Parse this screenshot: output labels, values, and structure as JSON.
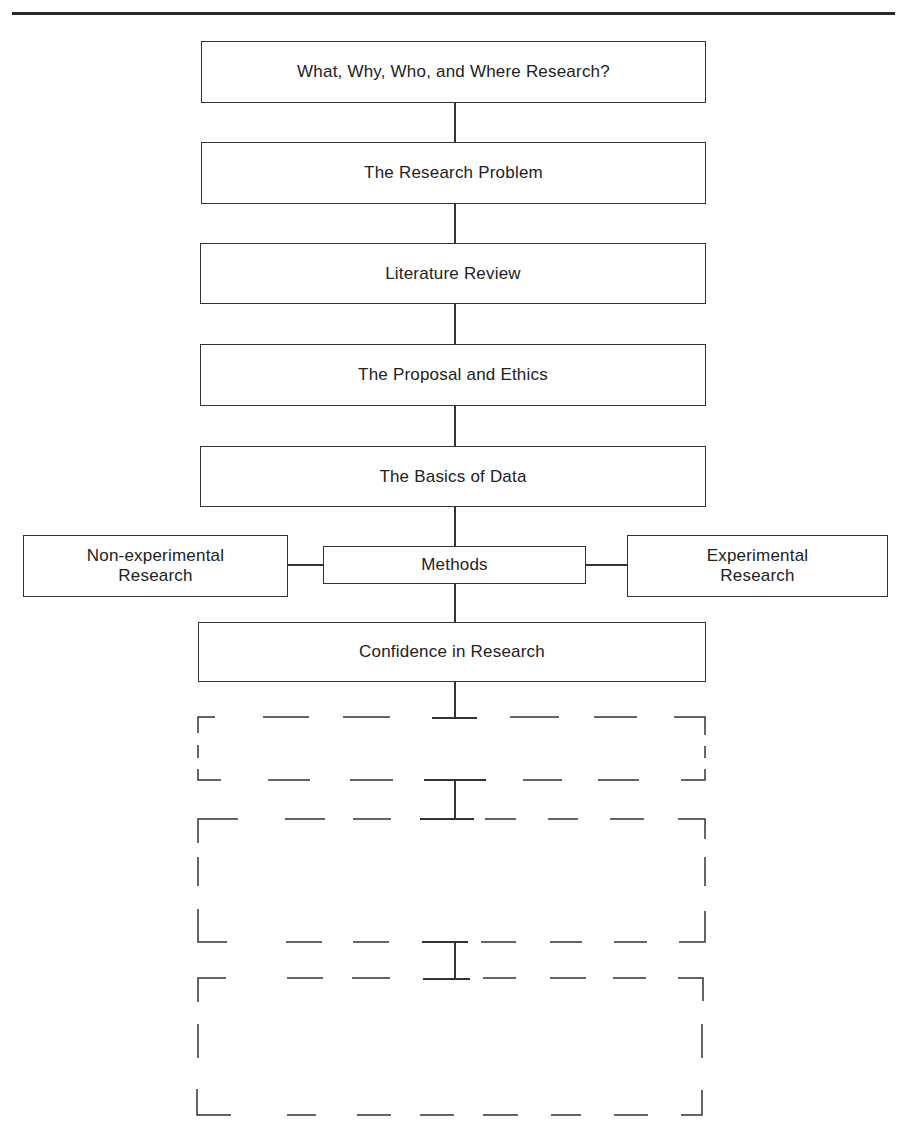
{
  "diagram": {
    "type": "flowchart",
    "main_steps": [
      {
        "id": "step1",
        "label": "What, Why, Who, and Where Research?"
      },
      {
        "id": "step2",
        "label": "The Research Problem"
      },
      {
        "id": "step3",
        "label": "Literature Review"
      },
      {
        "id": "step4",
        "label": "The Proposal and Ethics"
      },
      {
        "id": "step5",
        "label": "The Basics of Data"
      },
      {
        "id": "step6",
        "label": "Methods"
      },
      {
        "id": "step7",
        "label": "Confidence in Research"
      }
    ],
    "branches": {
      "left": {
        "line1": "Non-experimental",
        "line2": "Research"
      },
      "right": {
        "line1": "Experimental",
        "line2": "Research"
      }
    },
    "placeholder_boxes": [
      {
        "id": "future1",
        "style": "dashed",
        "label": ""
      },
      {
        "id": "future2",
        "style": "dashed",
        "label": ""
      },
      {
        "id": "future3",
        "style": "dashed",
        "label": ""
      }
    ],
    "connections": [
      [
        "step1",
        "step2"
      ],
      [
        "step2",
        "step3"
      ],
      [
        "step3",
        "step4"
      ],
      [
        "step4",
        "step5"
      ],
      [
        "step5",
        "step6"
      ],
      [
        "step6",
        "left"
      ],
      [
        "step6",
        "right"
      ],
      [
        "step6",
        "step7"
      ],
      [
        "step7",
        "future1"
      ],
      [
        "future1",
        "future2"
      ],
      [
        "future2",
        "future3"
      ]
    ]
  },
  "colors": {
    "line": "#333333",
    "text": "#222222",
    "background": "#ffffff"
  }
}
